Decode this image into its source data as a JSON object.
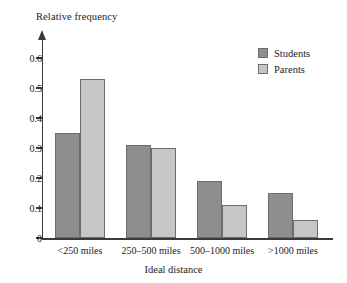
{
  "chart_data": {
    "type": "bar",
    "title": "",
    "xlabel": "Ideal distance",
    "ylabel": "Relative frequency",
    "categories": [
      "<250 miles",
      "250–500 miles",
      "500–1000 miles",
      ">1000 miles"
    ],
    "series": [
      {
        "name": "Students",
        "color": "#8e8e8e",
        "values": [
          0.35,
          0.31,
          0.19,
          0.15
        ]
      },
      {
        "name": "Parents",
        "color": "#c6c6c6",
        "values": [
          0.53,
          0.3,
          0.11,
          0.06
        ]
      }
    ],
    "ylim": [
      0,
      0.65
    ],
    "yticks": [
      0,
      0.1,
      0.2,
      0.3,
      0.4,
      0.5,
      0.6
    ],
    "ytick_labels": [
      "0",
      "0.1",
      "0.2",
      "0.3",
      "0.4",
      "0.5",
      "0.6"
    ],
    "grid": false,
    "legend_position": "top-right"
  },
  "legend": {
    "entries": [
      {
        "label": "Students"
      },
      {
        "label": "Parents"
      }
    ]
  },
  "axes": {
    "y_title": "Relative frequency",
    "x_title": "Ideal distance",
    "y_tick_labels": [
      "0.6",
      "0.5",
      "0.4",
      "0.3",
      "0.2",
      "0.1",
      "0"
    ],
    "x_tick_labels": [
      "<250 miles",
      "250–500 miles",
      "500–1000 miles",
      ">1000 miles"
    ]
  }
}
